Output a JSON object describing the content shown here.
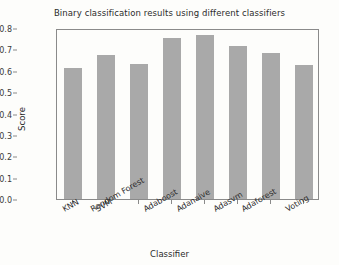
{
  "chart_data": {
    "type": "bar",
    "title": "Binary classification results using different classifiers",
    "xlabel": "Classifier",
    "ylabel": "Score",
    "categories": [
      "KNN",
      "SVM",
      "Random Forest",
      "Adaboost",
      "Adanaive",
      "Adasvm",
      "Adaforest",
      "Voting"
    ],
    "values": [
      0.615,
      0.675,
      0.63,
      0.755,
      0.765,
      0.715,
      0.685,
      0.625
    ],
    "ylim": [
      0.0,
      0.8
    ],
    "ytick_labels": [
      "0.0",
      "0.1",
      "0.2",
      "0.3",
      "0.4",
      "0.5",
      "0.6",
      "0.7",
      "0.8"
    ],
    "ytick_values": [
      0.0,
      0.1,
      0.2,
      0.3,
      0.4,
      0.5,
      0.6,
      0.7,
      0.8
    ],
    "grid": false,
    "legend": "none",
    "bar_color": "#a9a9a9",
    "frame_color": "#8a8a8a",
    "background_color": "#fdfdfb"
  }
}
